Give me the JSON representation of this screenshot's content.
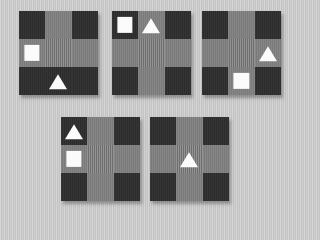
{
  "scene": {
    "background_color": "#c9c9c9",
    "panel_count": 5,
    "shape_color": "#fbfbfb",
    "dark_tile_color": "#2e2e2e",
    "light_tile_color": "#808080",
    "striped_tile_color": "#7d7d7d"
  },
  "panels": [
    {
      "id": "panel-1",
      "left": 19,
      "top": 11,
      "width": 79,
      "height": 84,
      "tiles": [
        {
          "kind": "dark",
          "shape": null
        },
        {
          "kind": "light",
          "shape": null
        },
        {
          "kind": "dark",
          "shape": null
        },
        {
          "kind": "light",
          "shape": "square"
        },
        {
          "kind": "striped",
          "shape": null
        },
        {
          "kind": "light",
          "shape": null
        },
        {
          "kind": "dark",
          "shape": null
        },
        {
          "kind": "dark",
          "shape": "triangle"
        },
        {
          "kind": "dark",
          "shape": null
        }
      ]
    },
    {
      "id": "panel-2",
      "left": 112,
      "top": 11,
      "width": 79,
      "height": 84,
      "tiles": [
        {
          "kind": "dark",
          "shape": "square"
        },
        {
          "kind": "light",
          "shape": "triangle"
        },
        {
          "kind": "dark",
          "shape": null
        },
        {
          "kind": "light",
          "shape": null
        },
        {
          "kind": "striped",
          "shape": null
        },
        {
          "kind": "light",
          "shape": null
        },
        {
          "kind": "dark",
          "shape": null
        },
        {
          "kind": "light",
          "shape": null
        },
        {
          "kind": "dark",
          "shape": null
        }
      ]
    },
    {
      "id": "panel-3",
      "left": 202,
      "top": 11,
      "width": 79,
      "height": 84,
      "tiles": [
        {
          "kind": "dark",
          "shape": null
        },
        {
          "kind": "light",
          "shape": null
        },
        {
          "kind": "dark",
          "shape": null
        },
        {
          "kind": "light",
          "shape": null
        },
        {
          "kind": "striped",
          "shape": null
        },
        {
          "kind": "light",
          "shape": "triangle"
        },
        {
          "kind": "dark",
          "shape": null
        },
        {
          "kind": "light",
          "shape": "square"
        },
        {
          "kind": "dark",
          "shape": null
        }
      ]
    },
    {
      "id": "panel-4",
      "left": 61,
      "top": 117,
      "width": 79,
      "height": 84,
      "tiles": [
        {
          "kind": "dark",
          "shape": "triangle"
        },
        {
          "kind": "light",
          "shape": null
        },
        {
          "kind": "dark",
          "shape": null
        },
        {
          "kind": "light",
          "shape": "square"
        },
        {
          "kind": "striped",
          "shape": null
        },
        {
          "kind": "light",
          "shape": null
        },
        {
          "kind": "dark",
          "shape": null
        },
        {
          "kind": "light",
          "shape": null
        },
        {
          "kind": "dark",
          "shape": null
        }
      ]
    },
    {
      "id": "panel-5",
      "left": 150,
      "top": 117,
      "width": 79,
      "height": 84,
      "tiles": [
        {
          "kind": "dark",
          "shape": null
        },
        {
          "kind": "light",
          "shape": null
        },
        {
          "kind": "dark",
          "shape": null
        },
        {
          "kind": "light",
          "shape": null
        },
        {
          "kind": "striped",
          "shape": "triangle"
        },
        {
          "kind": "light",
          "shape": null
        },
        {
          "kind": "dark",
          "shape": null
        },
        {
          "kind": "light",
          "shape": null
        },
        {
          "kind": "dark",
          "shape": null
        }
      ]
    }
  ]
}
